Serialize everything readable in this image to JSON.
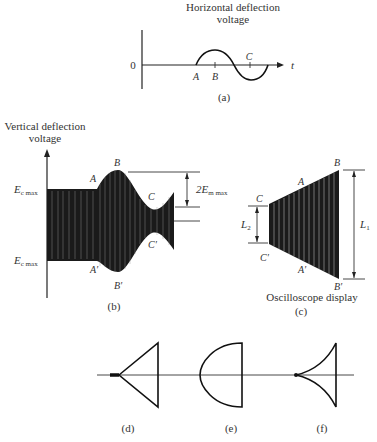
{
  "panel_a": {
    "title_line1": "Horizontal deflection",
    "title_line2": "voltage",
    "zero_label": "0",
    "axis_label": "t",
    "point_A": "A",
    "point_B": "B",
    "point_C": "C",
    "caption": "(a)"
  },
  "panel_b": {
    "title_line1": "Vertical deflection",
    "title_line2": "voltage",
    "upper_level": "E",
    "upper_level_sub": "c max",
    "lower_level": "E",
    "lower_level_sub": "c max",
    "point_A": "A",
    "point_A_prime": "A′",
    "point_B": "B",
    "point_B_prime": "B′",
    "point_C": "C",
    "point_C_prime": "C′",
    "dimension_label": "2E",
    "dimension_sub": "m max",
    "caption": "(b)"
  },
  "panel_c": {
    "point_A": "A",
    "point_A_prime": "A′",
    "point_B": "B",
    "point_B_prime": "B′",
    "point_C": "C",
    "point_C_prime": "C′",
    "dim_L2": "L",
    "dim_L2_sub": "2",
    "dim_L1": "L",
    "dim_L1_sub": "1",
    "subtitle": "Oscilloscope display",
    "caption": "(c)"
  },
  "patterns": {
    "d_caption": "(d)",
    "e_caption": "(e)",
    "f_caption": "(f)"
  }
}
